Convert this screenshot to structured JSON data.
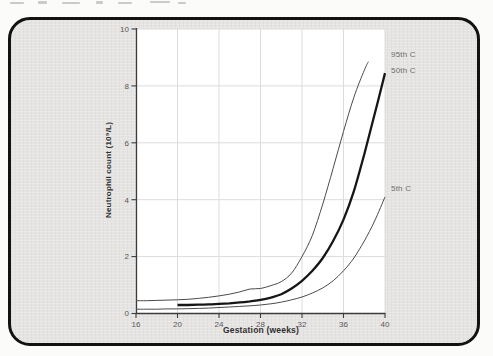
{
  "card": {
    "background": "#e5e4e2",
    "border_color": "#121212"
  },
  "chart_data": {
    "type": "line",
    "title": "",
    "xlabel": "Gestation (weeks)",
    "ylabel": "Neutrophil count (10⁹/L)",
    "xlim": [
      16,
      40
    ],
    "ylim": [
      0,
      10
    ],
    "x_ticks": [
      16,
      20,
      24,
      28,
      32,
      36,
      40
    ],
    "y_ticks": [
      0,
      2,
      4,
      6,
      8,
      10
    ],
    "grid": true,
    "plot_background": "#ffffff",
    "grid_color": "#dcdcdc",
    "axis_color": "#3c3c3c",
    "tick_label_color": "#585858",
    "annotation_color": "#6e6e6e",
    "legend_position": "labels right of plot",
    "series": [
      {
        "name": "95th C",
        "color": "#4b4b4b",
        "width": 1,
        "x": [
          16,
          17,
          18,
          19,
          20,
          21,
          22,
          23,
          24,
          25,
          26,
          27,
          28,
          29,
          30,
          31,
          32,
          33,
          34,
          35,
          36,
          37,
          38,
          38.4
        ],
        "values": [
          0.45,
          0.45,
          0.46,
          0.47,
          0.48,
          0.5,
          0.53,
          0.57,
          0.62,
          0.68,
          0.76,
          0.86,
          0.88,
          0.98,
          1.12,
          1.42,
          2.0,
          2.75,
          3.85,
          5.1,
          6.4,
          7.6,
          8.55,
          8.85
        ]
      },
      {
        "name": "50th C",
        "color": "#161616",
        "width": 2.3,
        "x": [
          20,
          21,
          22,
          23,
          24,
          25,
          26,
          27,
          28,
          29,
          30,
          31,
          32,
          33,
          34,
          35,
          36,
          37,
          38,
          39,
          40
        ],
        "values": [
          0.3,
          0.3,
          0.31,
          0.32,
          0.34,
          0.36,
          0.39,
          0.43,
          0.48,
          0.56,
          0.68,
          0.88,
          1.15,
          1.5,
          1.95,
          2.55,
          3.3,
          4.3,
          5.6,
          7.0,
          8.45
        ]
      },
      {
        "name": "5th C",
        "color": "#4b4b4b",
        "width": 1,
        "x": [
          16,
          17,
          18,
          19,
          20,
          21,
          22,
          23,
          24,
          25,
          26,
          27,
          28,
          29,
          30,
          31,
          32,
          33,
          34,
          35,
          36,
          37,
          38,
          39,
          40
        ],
        "values": [
          0.15,
          0.15,
          0.15,
          0.16,
          0.16,
          0.17,
          0.18,
          0.19,
          0.21,
          0.23,
          0.25,
          0.27,
          0.3,
          0.34,
          0.4,
          0.48,
          0.58,
          0.72,
          0.9,
          1.15,
          1.5,
          1.95,
          2.55,
          3.25,
          4.1
        ]
      }
    ]
  }
}
